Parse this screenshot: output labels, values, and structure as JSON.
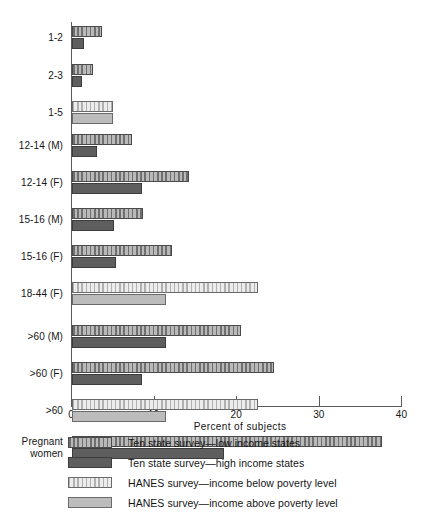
{
  "chart_data": {
    "type": "bar",
    "orientation": "horizontal",
    "title": "",
    "xlabel": "Percent of subjects",
    "ylabel": "",
    "xlim": [
      0,
      40
    ],
    "xticks": [
      0,
      10,
      20,
      30,
      40
    ],
    "grid": false,
    "legend_position": "below",
    "categories": [
      "1-2",
      "2-3",
      "1-5",
      "12-14 (M)",
      "12-14 (F)",
      "15-16 (M)",
      "15-16 (F)",
      "18-44 (F)",
      ">60 (M)",
      ">60 (F)",
      ">60",
      "Pregnant women"
    ],
    "series": [
      {
        "name": "Ten state survey—low income states",
        "key": "ten_low",
        "values": [
          3.6,
          2.5,
          null,
          7.3,
          14.2,
          8.6,
          12.1,
          null,
          20.5,
          24.5,
          null,
          37.5
        ]
      },
      {
        "name": "Ten state survey—high income states",
        "key": "ten_high",
        "values": [
          1.5,
          1.2,
          null,
          3.0,
          8.5,
          5.1,
          5.3,
          null,
          11.4,
          8.5,
          null,
          18.4
        ]
      },
      {
        "name": "HANES survey—income below poverty level",
        "key": "hanes_below",
        "values": [
          null,
          null,
          5.0,
          null,
          null,
          null,
          null,
          22.5,
          null,
          null,
          22.5,
          null
        ]
      },
      {
        "name": "HANES survey—income above poverty level",
        "key": "hanes_above",
        "values": [
          null,
          null,
          5.0,
          null,
          null,
          null,
          null,
          11.4,
          null,
          null,
          11.4,
          null
        ]
      }
    ],
    "groups": [
      {
        "label": "1-2",
        "label_lines": [
          "1-2"
        ],
        "top": 26,
        "bars": [
          {
            "series": "ten_low",
            "value": 3.6
          },
          {
            "series": "ten_high",
            "value": 1.5
          }
        ]
      },
      {
        "label": "2-3",
        "label_lines": [
          "2-3"
        ],
        "top": 64,
        "bars": [
          {
            "series": "ten_low",
            "value": 2.5
          },
          {
            "series": "ten_high",
            "value": 1.2
          }
        ]
      },
      {
        "label": "1-5",
        "label_lines": [
          "1-5"
        ],
        "top": 101,
        "bars": [
          {
            "series": "hanes_below",
            "value": 5.0
          },
          {
            "series": "hanes_above",
            "value": 5.0
          }
        ]
      },
      {
        "label": "12-14 (M)",
        "label_lines": [
          "12-14 (M)"
        ],
        "top": 134,
        "bars": [
          {
            "series": "ten_low",
            "value": 7.3
          },
          {
            "series": "ten_high",
            "value": 3.0
          }
        ]
      },
      {
        "label": "12-14 (F)",
        "label_lines": [
          "12-14 (F)"
        ],
        "top": 171,
        "bars": [
          {
            "series": "ten_low",
            "value": 14.2
          },
          {
            "series": "ten_high",
            "value": 8.5
          }
        ]
      },
      {
        "label": "15-16 (M)",
        "label_lines": [
          "15-16 (M)"
        ],
        "top": 208,
        "bars": [
          {
            "series": "ten_low",
            "value": 8.6
          },
          {
            "series": "ten_high",
            "value": 5.1
          }
        ]
      },
      {
        "label": "15-16 (F)",
        "label_lines": [
          "15-16 (F)"
        ],
        "top": 245,
        "bars": [
          {
            "series": "ten_low",
            "value": 12.1
          },
          {
            "series": "ten_high",
            "value": 5.3
          }
        ]
      },
      {
        "label": "18-44 (F)",
        "label_lines": [
          "18-44 (F)"
        ],
        "top": 282,
        "bars": [
          {
            "series": "hanes_below",
            "value": 22.5
          },
          {
            "series": "hanes_above",
            "value": 11.4
          }
        ]
      },
      {
        "label": ">60 (M)",
        "label_lines": [
          ">60 (M)"
        ],
        "top": 325,
        "bars": [
          {
            "series": "ten_low",
            "value": 20.5
          },
          {
            "series": "ten_high",
            "value": 11.4
          }
        ]
      },
      {
        "label": ">60 (F)",
        "label_lines": [
          ">60 (F)"
        ],
        "top": 362,
        "bars": [
          {
            "series": "ten_low",
            "value": 24.5
          },
          {
            "series": "ten_high",
            "value": 8.5
          }
        ]
      },
      {
        "label": ">60",
        "label_lines": [
          ">60"
        ],
        "top": 399,
        "bars": [
          {
            "series": "hanes_below",
            "value": 22.5
          },
          {
            "series": "hanes_above",
            "value": 11.4
          }
        ]
      },
      {
        "label": "Pregnant women",
        "label_lines": [
          "Pregnant",
          "women"
        ],
        "top": 436,
        "bars": [
          {
            "series": "ten_low",
            "value": 37.5
          },
          {
            "series": "ten_high",
            "value": 18.4
          }
        ]
      }
    ]
  },
  "axis": {
    "x_title": "Percent of subjects",
    "ticks": [
      {
        "value": 0,
        "label": "0"
      },
      {
        "value": 10,
        "label": "10"
      },
      {
        "value": 20,
        "label": "20"
      },
      {
        "value": 30,
        "label": "30"
      },
      {
        "value": 40,
        "label": "40"
      }
    ]
  },
  "legend": {
    "items": [
      {
        "label": "Ten state survey—low income states",
        "key": "ten_low"
      },
      {
        "label": "Ten state survey—high income states",
        "key": "ten_high"
      },
      {
        "label": "HANES survey—income below poverty level",
        "key": "hanes_below"
      },
      {
        "label": "HANES survey—income above poverty level",
        "key": "hanes_above"
      }
    ]
  },
  "colors": {
    "ten_low_fill": "#9a9a9a",
    "ten_high_fill": "#5e5e5e",
    "hanes_below_fill": "#d8d8d8",
    "hanes_above_fill": "#bcbcbc",
    "axis": "#5a5a5a",
    "text": "#151515",
    "background": "#ffffff"
  }
}
